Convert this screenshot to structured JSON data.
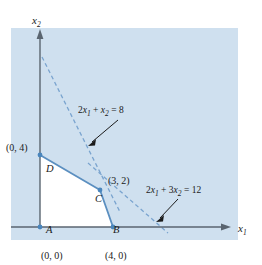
{
  "figure": {
    "type": "linear-programming-feasible-region",
    "panel": {
      "fill": "#cfe0ef",
      "x": 11,
      "y": 28,
      "width": 227,
      "height": 212
    },
    "colors": {
      "background": "#ffffff",
      "panel_fill": "#cfe0ef",
      "feasible_region_fill": "#ffffff",
      "constraint_line": "#5b8fc0",
      "dashed_line": "#7aa4cf",
      "axis": "#5a6570",
      "text": "#1a1a1a",
      "point_marker": "#4a86bd",
      "arrow": "#1a1a1a"
    },
    "axes": {
      "x_label": "x",
      "x_label_sub": "1",
      "y_label": "x",
      "y_label_sub": "2",
      "origin_px": {
        "x": 40,
        "y": 227
      }
    },
    "vertices": [
      {
        "name": "A",
        "coord": "(0, 0)",
        "x": 0,
        "y": 0,
        "label_px": {
          "x": 46,
          "y": 233
        },
        "coord_px": {
          "x": 42,
          "y": 256
        },
        "marker": true
      },
      {
        "name": "B",
        "coord": "(4, 0)",
        "x": 4,
        "y": 0,
        "label_px": {
          "x": 113,
          "y": 233
        },
        "coord_px": {
          "x": 107,
          "y": 256
        },
        "marker": true
      },
      {
        "name": "C",
        "coord": "(3, 2)",
        "x": 3,
        "y": 2,
        "label_px": {
          "x": 98,
          "y": 196
        },
        "coord_px": {
          "x": 110,
          "y": 182
        },
        "marker": true
      },
      {
        "name": "D",
        "coord": "(0, 4)",
        "x": 0,
        "y": 4,
        "label_px": {
          "x": 46,
          "y": 163
        },
        "coord_px": {
          "x": 8,
          "y": 148
        },
        "marker": true
      }
    ],
    "constraints": [
      {
        "id": "constraint-1",
        "equation_lhs_a": "2",
        "equation_var1": "x",
        "equation_var1_sub": "1",
        "equation_plus": "+",
        "equation_lhs_b": "",
        "equation_var2": "x",
        "equation_var2_sub": "2",
        "equation_eq": "=",
        "equation_rhs": "8",
        "full_text": "2x1 + x2 = 8",
        "style": "dashed",
        "label_px": {
          "x": 80,
          "y": 112
        },
        "arrow_from": {
          "x": 118,
          "y": 120
        },
        "arrow_to": {
          "x": 89,
          "y": 145
        }
      },
      {
        "id": "constraint-2",
        "equation_lhs_a": "2",
        "equation_var1": "x",
        "equation_var1_sub": "1",
        "equation_plus": "+",
        "equation_lhs_b": "3",
        "equation_var2": "x",
        "equation_var2_sub": "2",
        "equation_eq": "=",
        "equation_rhs": "12",
        "full_text": "2x1 + 3x2 = 12",
        "style": "dashed",
        "label_px": {
          "x": 148,
          "y": 192
        },
        "arrow_from": {
          "x": 178,
          "y": 199
        },
        "arrow_to": {
          "x": 157,
          "y": 221
        }
      }
    ],
    "feasible_region_points": "40,227 113,227 100,190 40,155",
    "dashed_line_1": {
      "x1": 42,
      "y1": 57,
      "x2": 120,
      "y2": 212
    },
    "dashed_line_2": {
      "x1": 88,
      "y1": 163,
      "x2": 168,
      "y2": 233
    }
  }
}
